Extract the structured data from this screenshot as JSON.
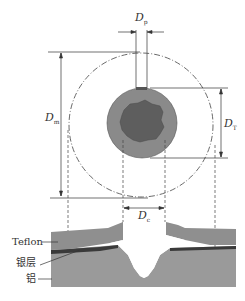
{
  "diagram": {
    "type": "cross-section schematic",
    "labels": {
      "dp": {
        "main": "D",
        "sub": "p"
      },
      "dm": {
        "main": "D",
        "sub": "m"
      },
      "dt": {
        "main": "D",
        "sub": "T"
      },
      "dc": {
        "main": "D",
        "sub": "c"
      }
    },
    "layers": {
      "teflon": "Teflon",
      "silver": "银层",
      "aluminum": "铝"
    },
    "colors": {
      "outer_disc": "#8a8a8a",
      "inner_core": "#5e5e5e",
      "teflon_layer": "#8f8f8f",
      "silver_layer": "#3a3a3a",
      "aluminum_layer": "#9a9a9a",
      "lines": "#333333"
    }
  }
}
